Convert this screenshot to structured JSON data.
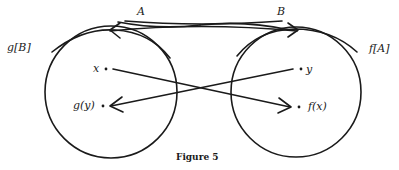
{
  "figure": {
    "caption": "Figure 5",
    "labels": {
      "A": "A",
      "B": "B",
      "left_set": "g[B]",
      "right_set": "f[A]",
      "x": "x",
      "y": "y",
      "gy": "g(y)",
      "fx": "f(x)"
    },
    "colors": {
      "stroke": "#1a1a1a",
      "background": "#ffffff"
    }
  }
}
